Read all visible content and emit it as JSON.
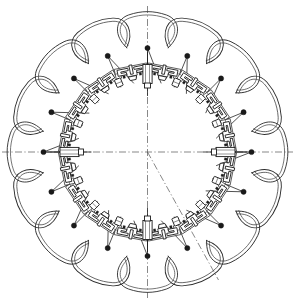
{
  "drawing": {
    "title": "Radial Petal Mechanism Assembly",
    "description": "Plan view of a sixteen-fold radially symmetric mechanism assembly with looped petal linkages, radial spokes and inner clamp mechanisms.",
    "sheet_background": "#ffffff",
    "line_color": "#1c1c1c",
    "centerline_color": "#555555",
    "node_color": "#1a1a1a"
  },
  "geometry": {
    "canvas_width": 295,
    "canvas_height": 303,
    "center_x": 147.5,
    "center_y": 152.0,
    "symmetry_count": 16,
    "node_ring_radius": 104.0,
    "petal_tip_radius": 128.0,
    "inner_ring_radius": 63.0,
    "mechanism_ring_radius": 76.0,
    "spoke_inner_radius": 70.0,
    "petal_half_angle_deg": 11.25,
    "angle_step_deg": 22.5,
    "node_dot_radius": 2.6,
    "petal_offset": 2.6
  },
  "centerlines": [
    {
      "name": "vertical-centerline",
      "angle_deg": 90,
      "extent": 150
    },
    {
      "name": "horizontal-centerline",
      "angle_deg": 0,
      "extent": 150
    },
    {
      "name": "diagonal-centerline",
      "angle_deg": -61,
      "extent": 146
    }
  ],
  "actuators": [
    {
      "name": "actuator-top",
      "angle_deg": 90,
      "label": "cylinder"
    },
    {
      "name": "actuator-right",
      "angle_deg": 0,
      "label": "cylinder"
    },
    {
      "name": "actuator-bottom",
      "angle_deg": 270,
      "label": "cylinder"
    },
    {
      "name": "actuator-left",
      "angle_deg": 180,
      "label": "cylinder"
    }
  ],
  "chart_data": {
    "type": "scatter",
    "xlabel": "",
    "ylabel": "",
    "symmetry_order": 16,
    "node_angles_deg": [
      90,
      67.5,
      45,
      22.5,
      0,
      337.5,
      315,
      292.5,
      270,
      247.5,
      225,
      202.5,
      180,
      157.5,
      135,
      112.5
    ],
    "node_radius": 104,
    "petal_count": 16,
    "mechanism_count": 16,
    "actuator_count": 4
  },
  "annotations": {
    "petal_label": "petal-loop-linkage",
    "spoke_label": "radial-spoke",
    "node_label": "pivot-node",
    "mechanism_label": "clamp-mechanism-block",
    "actuator_label": "linear-actuator-cylinder"
  }
}
